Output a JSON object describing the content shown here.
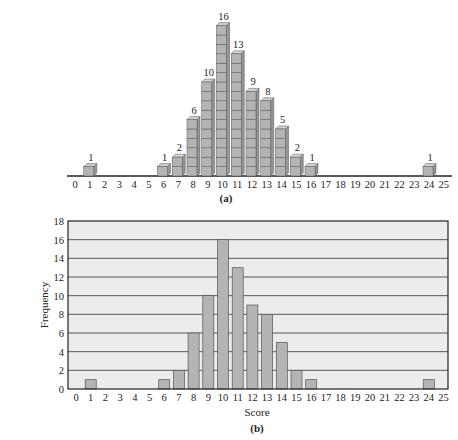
{
  "chart_data": [
    {
      "panel": "a",
      "type": "bar",
      "style": "stacked-unit-cubes (3D)",
      "caption": "(a)",
      "title": "",
      "xlabel": "",
      "ylabel": "",
      "x_ticks": [
        0,
        1,
        2,
        3,
        4,
        5,
        6,
        7,
        8,
        9,
        10,
        11,
        12,
        13,
        14,
        15,
        16,
        17,
        18,
        19,
        20,
        21,
        22,
        23,
        24,
        25
      ],
      "categories": [
        1,
        6,
        7,
        8,
        9,
        10,
        11,
        12,
        13,
        14,
        15,
        16,
        24
      ],
      "values": [
        1,
        1,
        2,
        6,
        10,
        16,
        13,
        9,
        8,
        5,
        2,
        1,
        1
      ],
      "data_labels": [
        "1",
        "1",
        "2",
        "6",
        "10",
        "16",
        "13",
        "9",
        "8",
        "5",
        "2",
        "1",
        "1"
      ],
      "grid": false
    },
    {
      "panel": "b",
      "type": "bar",
      "caption": "(b)",
      "title": "",
      "xlabel": "Score",
      "ylabel": "Frequency",
      "x_ticks": [
        0,
        1,
        2,
        3,
        4,
        5,
        6,
        7,
        8,
        9,
        10,
        11,
        12,
        13,
        14,
        15,
        16,
        17,
        18,
        19,
        20,
        21,
        22,
        23,
        24,
        25
      ],
      "y_ticks": [
        0,
        2,
        4,
        6,
        8,
        10,
        12,
        14,
        16,
        18
      ],
      "ylim": [
        0,
        18
      ],
      "xlim": [
        0,
        25
      ],
      "categories": [
        1,
        6,
        7,
        8,
        9,
        10,
        11,
        12,
        13,
        14,
        15,
        16,
        24
      ],
      "values": [
        1,
        1,
        2,
        6,
        10,
        16,
        13,
        9,
        8,
        5,
        2,
        1,
        1
      ],
      "grid": true,
      "grid_axis": "y"
    }
  ],
  "colors": {
    "bar_fill": "#b4b4b4",
    "bar_side": "#969696",
    "bar_top": "#d2d2d2",
    "bar_edge": "#555555",
    "plot_background": "#ececec",
    "grid_line": "#333333",
    "axis": "#222222"
  },
  "panel_a": {
    "caption": "(a)"
  },
  "panel_b": {
    "caption": "(b)",
    "xlabel": "Score",
    "ylabel": "Frequency"
  }
}
